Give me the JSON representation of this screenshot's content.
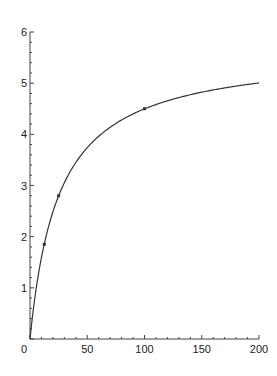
{
  "chart_data": {
    "type": "line",
    "title": "",
    "xlabel": "",
    "ylabel": "",
    "xlim": [
      0,
      200
    ],
    "ylim": [
      0,
      6
    ],
    "x_ticks": [
      "0",
      "50",
      "100",
      "150",
      "200"
    ],
    "y_ticks": [
      "1",
      "2",
      "3",
      "4",
      "5",
      "6"
    ],
    "grid": false,
    "legend": null,
    "series": [
      {
        "name": "curve",
        "kind": "line",
        "color": "#333333",
        "model": "y = 5.64*x/(25.4+x)",
        "x": [
          0,
          5,
          12.5,
          25,
          50,
          75,
          100,
          125,
          150,
          175,
          200
        ],
        "y": [
          0,
          0.93,
          1.86,
          2.8,
          3.74,
          4.21,
          4.5,
          4.69,
          4.82,
          4.92,
          5.0
        ]
      },
      {
        "name": "data points",
        "kind": "scatter",
        "color": "#333333",
        "x": [
          12.5,
          25,
          100
        ],
        "y": [
          1.85,
          2.8,
          4.5
        ]
      }
    ]
  },
  "origin_label": "0"
}
